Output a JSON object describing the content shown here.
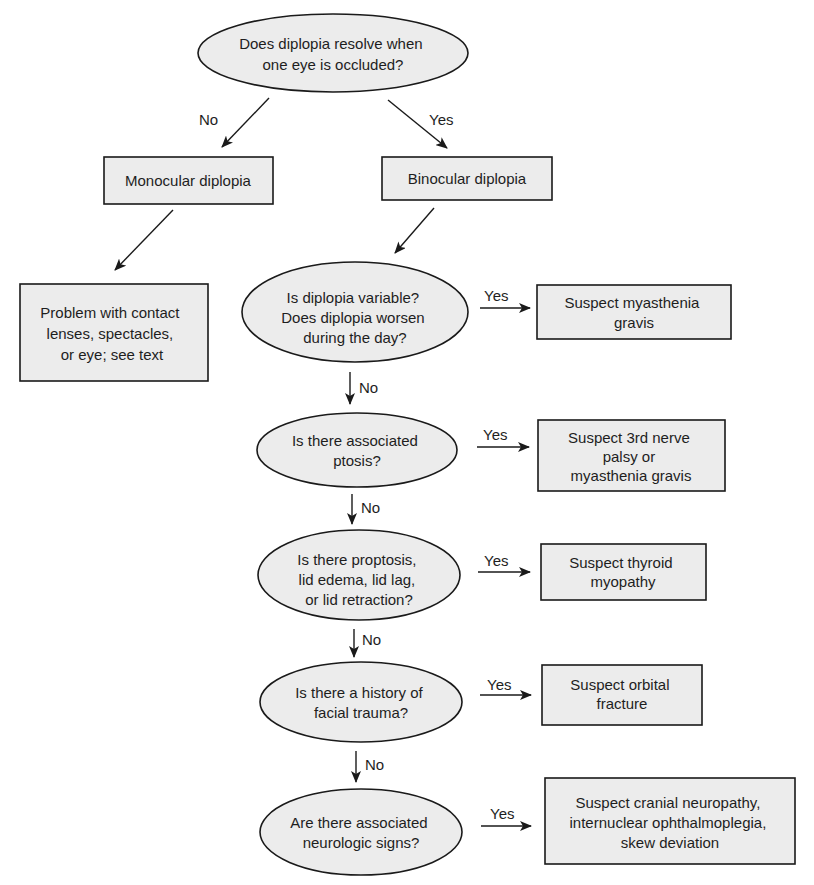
{
  "diagram": {
    "type": "flowchart",
    "colors": {
      "fill": "#ececec",
      "stroke": "#1a1a1a",
      "text": "#1e1e1e",
      "background": "#ffffff"
    },
    "nodes": [
      {
        "id": "q_occluded",
        "shape": "ellipse",
        "lines": [
          "Does diplopia resolve when",
          "one eye is occluded?"
        ]
      },
      {
        "id": "monocular",
        "shape": "box",
        "lines": [
          "Monocular diplopia"
        ]
      },
      {
        "id": "binocular",
        "shape": "box",
        "lines": [
          "Binocular diplopia"
        ]
      },
      {
        "id": "mono_cause",
        "shape": "box",
        "lines": [
          "Problem with contact",
          "lenses, spectacles,",
          "or eye; see text"
        ]
      },
      {
        "id": "q_variable",
        "shape": "ellipse",
        "lines": [
          "Is diplopia variable?",
          "Does diplopia worsen",
          "during the day?"
        ]
      },
      {
        "id": "r_myasthenia",
        "shape": "box",
        "lines": [
          "Suspect myasthenia",
          "gravis"
        ]
      },
      {
        "id": "q_ptosis",
        "shape": "ellipse",
        "lines": [
          "Is there associated",
          "ptosis?"
        ]
      },
      {
        "id": "r_third_nerve",
        "shape": "box",
        "lines": [
          "Suspect 3rd nerve",
          "palsy or",
          "myasthenia gravis"
        ]
      },
      {
        "id": "q_proptosis",
        "shape": "ellipse",
        "lines": [
          "Is there proptosis,",
          "lid edema, lid lag,",
          "or lid retraction?"
        ]
      },
      {
        "id": "r_thyroid",
        "shape": "box",
        "lines": [
          "Suspect thyroid",
          "myopathy"
        ]
      },
      {
        "id": "q_trauma",
        "shape": "ellipse",
        "lines": [
          "Is there a history of",
          "facial trauma?"
        ]
      },
      {
        "id": "r_orbital",
        "shape": "box",
        "lines": [
          "Suspect orbital",
          "fracture"
        ]
      },
      {
        "id": "q_neuro",
        "shape": "ellipse",
        "lines": [
          "Are there associated",
          "neurologic signs?"
        ]
      },
      {
        "id": "r_cranial",
        "shape": "box",
        "lines": [
          "Suspect cranial neuropathy,",
          "internuclear ophthalmoplegia,",
          "skew deviation"
        ]
      }
    ],
    "edges": [
      {
        "from": "q_occluded",
        "to": "monocular",
        "label": "No"
      },
      {
        "from": "q_occluded",
        "to": "binocular",
        "label": "Yes"
      },
      {
        "from": "monocular",
        "to": "mono_cause",
        "label": ""
      },
      {
        "from": "binocular",
        "to": "q_variable",
        "label": ""
      },
      {
        "from": "q_variable",
        "to": "r_myasthenia",
        "label": "Yes"
      },
      {
        "from": "q_variable",
        "to": "q_ptosis",
        "label": "No"
      },
      {
        "from": "q_ptosis",
        "to": "r_third_nerve",
        "label": "Yes"
      },
      {
        "from": "q_ptosis",
        "to": "q_proptosis",
        "label": "No"
      },
      {
        "from": "q_proptosis",
        "to": "r_thyroid",
        "label": "Yes"
      },
      {
        "from": "q_proptosis",
        "to": "q_trauma",
        "label": "No"
      },
      {
        "from": "q_trauma",
        "to": "r_orbital",
        "label": "Yes"
      },
      {
        "from": "q_trauma",
        "to": "q_neuro",
        "label": "No"
      },
      {
        "from": "q_neuro",
        "to": "r_cranial",
        "label": "Yes"
      }
    ]
  }
}
